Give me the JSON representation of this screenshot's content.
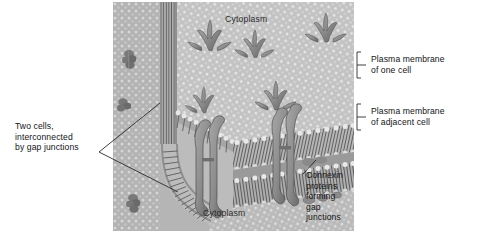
{
  "figure": {
    "style": "grayscale biological illustration",
    "background_color": "#ffffff",
    "illustration_fill": "#b9b9b9"
  },
  "labels": {
    "cytoplasm_top": "Cytoplasm",
    "cytoplasm_bottom": "Cytoplasm",
    "two_cells": "Two cells,\ninterconnected\nby gap junctions",
    "plasma_membrane_one": "Plasma membrane\nof one cell",
    "plasma_membrane_adjacent": "Plasma membrane\nof adjacent cell",
    "connexin": "Connexin\nproteins\nforming\ngap\njunctions"
  },
  "icons": {
    "bracket_upper": "bracket-icon",
    "bracket_lower": "bracket-icon",
    "leader_left": "leader-line-icon",
    "leader_connexin": "leader-line-icon"
  },
  "colors": {
    "text": "#141414",
    "leader_line": "#2a2a2a",
    "membrane_light": "#d4d4d4",
    "membrane_mid": "#aeaeae",
    "membrane_dark": "#7d7d7d",
    "protein": "#8c8c8c",
    "protein_shadow": "#5f5f5f"
  }
}
